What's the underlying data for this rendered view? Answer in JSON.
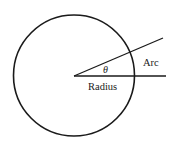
{
  "diagram": {
    "labels": {
      "theta": "θ",
      "arc": "Arc",
      "radius": "Radius"
    },
    "colors": {
      "stroke": "#1a1a1a",
      "background": "#ffffff"
    }
  }
}
